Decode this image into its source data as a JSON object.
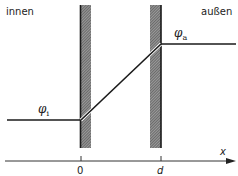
{
  "diagram": {
    "labels": {
      "inside": "innen",
      "outside": "außen",
      "phi_inside": {
        "symbol": "φ",
        "subscript": "i"
      },
      "phi_outside": {
        "symbol": "φ",
        "subscript": "a"
      }
    },
    "axis": {
      "variable": "x",
      "ticks": [
        "0",
        "d"
      ]
    },
    "walls": [
      {
        "position": "0",
        "hatched": true
      },
      {
        "position": "d",
        "hatched": true
      }
    ],
    "profile": [
      {
        "segment": "inside",
        "level": "φi",
        "type": "constant"
      },
      {
        "segment": "wall region 0..d",
        "type": "linear rise",
        "from": "φi",
        "to": "φa"
      },
      {
        "segment": "outside",
        "level": "φa",
        "type": "constant"
      }
    ],
    "colors": {
      "line": "#1a1a1a",
      "background": "#ffffff",
      "hatch": "#555555"
    }
  }
}
